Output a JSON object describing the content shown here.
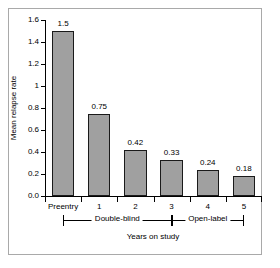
{
  "chart_data": {
    "type": "bar",
    "title": "",
    "xlabel": "Years on study",
    "ylabel": "Mean relapse rate",
    "categories": [
      "Preentry",
      "1",
      "2",
      "3",
      "4",
      "5"
    ],
    "values": [
      1.5,
      0.75,
      0.42,
      0.33,
      0.24,
      0.18
    ],
    "value_labels": [
      "1.5",
      "0.75",
      "0.42",
      "0.33",
      "0.24",
      "0.18"
    ],
    "ylim": [
      0.0,
      1.6
    ],
    "ytick_values": [
      0.0,
      0.2,
      0.4,
      0.6,
      0.8,
      1.0,
      1.2,
      1.4,
      1.6
    ],
    "ytick_labels": [
      "0.0",
      "0.2",
      "0.4",
      "0.6",
      "0.8",
      "1",
      "1.2",
      "1.4",
      "1.6"
    ],
    "grid": false,
    "legend": "none",
    "bar_color": "#a0a0a0",
    "bar_edge_color": "#1a1a1a",
    "axis_color": "#000000",
    "frame_color": "#a9a9a9",
    "groups": [
      {
        "label": "Double-blind",
        "from_category": "Preentry",
        "to_category": "3"
      },
      {
        "label": "Open-label",
        "from_category": "3",
        "to_category": "5"
      }
    ]
  }
}
